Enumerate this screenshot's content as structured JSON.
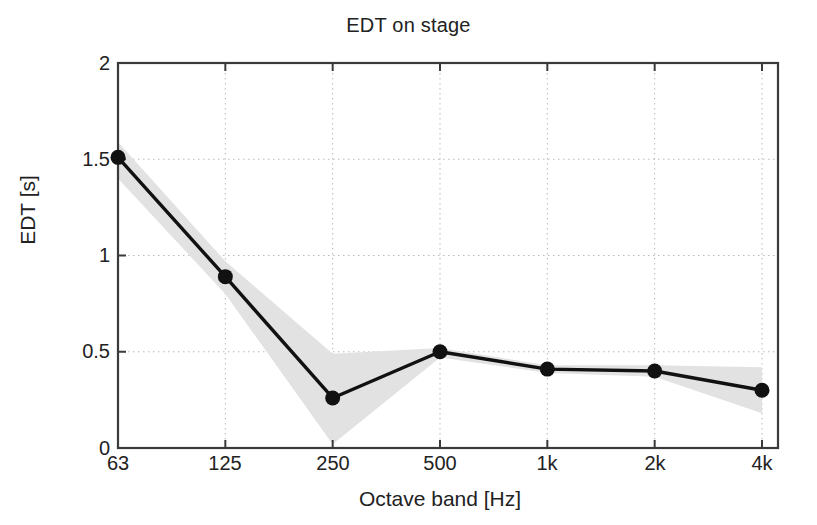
{
  "chart_data": {
    "type": "line",
    "title": "EDT on stage",
    "xlabel": "Octave band [Hz]",
    "ylabel": "EDT [s]",
    "categories": [
      "63",
      "125",
      "250",
      "500",
      "1k",
      "2k",
      "4k"
    ],
    "values": [
      1.51,
      0.89,
      0.26,
      0.5,
      0.41,
      0.4,
      0.3
    ],
    "series": [
      {
        "name": "EDT mean",
        "values": [
          1.51,
          0.89,
          0.26,
          0.5,
          0.41,
          0.4,
          0.3
        ]
      },
      {
        "name": "spread upper",
        "values": [
          1.59,
          0.97,
          0.49,
          0.52,
          0.43,
          0.43,
          0.42
        ]
      },
      {
        "name": "spread lower",
        "values": [
          1.4,
          0.8,
          0.02,
          0.47,
          0.39,
          0.37,
          0.18
        ]
      }
    ],
    "ylim": [
      0,
      2
    ],
    "yticks": [
      0,
      0.5,
      1,
      1.5,
      2
    ],
    "ytick_labels": [
      "0",
      "0.5",
      "1",
      "1.5",
      "2"
    ],
    "xtick_labels": [
      "63",
      "125",
      "250",
      "500",
      "1k",
      "2k",
      "4k"
    ],
    "grid": true,
    "grid_style": "dotted",
    "legend": "none",
    "marker": "filled-circle",
    "line_color": "#111111",
    "band_color": "#e2e2e2",
    "axis_color": "#3a3a3a",
    "background": "#ffffff"
  },
  "figure": {
    "title": "EDT on stage",
    "xlabel": "Octave band [Hz]",
    "ylabel": "EDT [s]"
  }
}
